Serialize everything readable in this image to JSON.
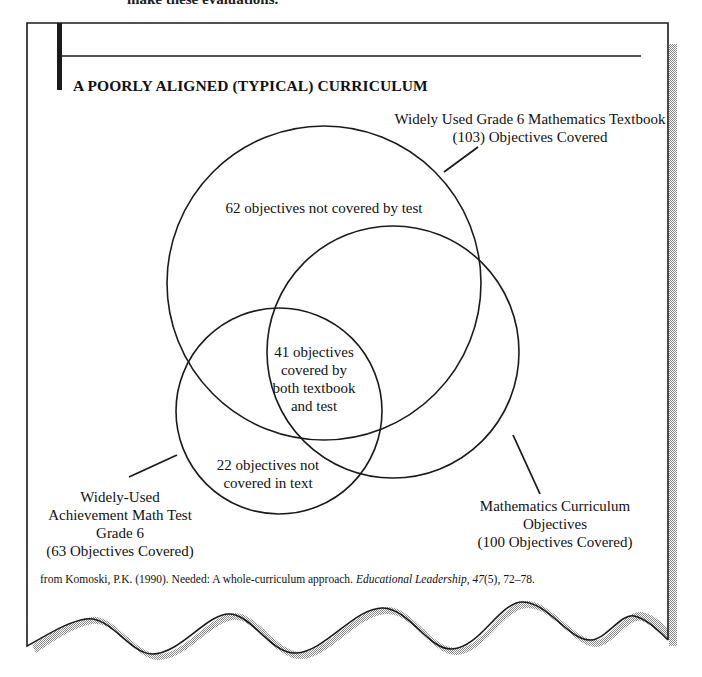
{
  "page": {
    "cutoff_text": "make these evaluations."
  },
  "figure": {
    "title": "A POORLY ALIGNED (TYPICAL) CURRICULUM",
    "colors": {
      "line": "#1a1a1a",
      "shadow": "#b8b8b8",
      "background": "#ffffff"
    }
  },
  "venn": {
    "sets": [
      {
        "id": "textbook",
        "label_line1": "Widely Used Grade 6 Mathematics Textbook",
        "label_line2": "(103) Objectives Covered",
        "total": 103
      },
      {
        "id": "test",
        "label_line1": "Widely-Used",
        "label_line2": "Achievement Math Test",
        "label_line3": "Grade 6",
        "label_line4": "(63 Objectives Covered)",
        "total": 63
      },
      {
        "id": "curriculum",
        "label_line1": "Mathematics Curriculum",
        "label_line2": "Objectives",
        "label_line3": "(100 Objectives Covered)",
        "total": 100
      }
    ],
    "regions": {
      "textbook_only": {
        "line1": "62 objectives not covered by test",
        "count": 62
      },
      "overlap": {
        "line1": "41 objectives",
        "line2": "covered by",
        "line3": "both textbook",
        "line4": "and test",
        "count": 41
      },
      "test_only": {
        "line1": "22 objectives not",
        "line2": "covered in text",
        "count": 22
      }
    }
  },
  "citation": {
    "prefix": "from Komoski, P.K. (1990). Needed: A whole-curriculum approach. ",
    "journal": "Educational Leadership",
    "sep": ", ",
    "volume": "47",
    "rest": "(5), 72–78."
  }
}
